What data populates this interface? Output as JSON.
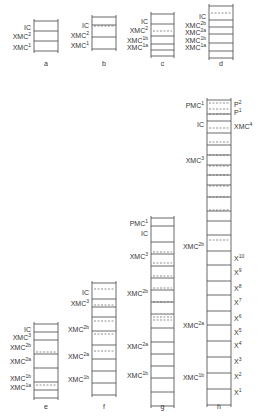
{
  "figure": {
    "width": 264,
    "height": 417,
    "stroke_color": "#444444",
    "panels": [
      {
        "id": "a",
        "label": "a",
        "x": 34,
        "w": 24,
        "top": 21,
        "label_y": 66,
        "segments": [
          10,
          10,
          10
        ],
        "dashed": [],
        "left_labels": [
          {
            "text": "IC",
            "sup": "",
            "y": 27
          },
          {
            "text": "XMC",
            "sup": "2",
            "y": 36
          },
          {
            "text": "XMC",
            "sup": "1",
            "y": 47
          }
        ],
        "right_labels": []
      },
      {
        "id": "b",
        "label": "b",
        "x": 92,
        "w": 24,
        "top": 17,
        "label_y": 66,
        "segments": [
          8,
          12,
          12
        ],
        "dashed": [
          26
        ],
        "left_labels": [
          {
            "text": "IC",
            "sup": "",
            "y": 25
          },
          {
            "text": "XMC",
            "sup": "2",
            "y": 35
          },
          {
            "text": "XMC",
            "sup": "1",
            "y": 45
          }
        ],
        "right_labels": []
      },
      {
        "id": "c",
        "label": "c",
        "x": 151,
        "w": 23,
        "top": 14,
        "label_y": 66,
        "segments": [
          10,
          12,
          8,
          6,
          6
        ],
        "dashed": [
          31
        ],
        "left_labels": [
          {
            "text": "IC",
            "sup": "",
            "y": 21
          },
          {
            "text": "XMC",
            "sup": "2",
            "y": 30
          },
          {
            "text": "XMC",
            "sup": "1b",
            "y": 40
          },
          {
            "text": "XMC",
            "sup": "1a",
            "y": 47
          }
        ],
        "right_labels": []
      },
      {
        "id": "d",
        "label": "d",
        "x": 209,
        "w": 24,
        "top": 6,
        "label_y": 66,
        "segments": [
          14,
          7,
          7,
          9,
          8,
          7
        ],
        "dashed": [
          13
        ],
        "left_labels": [
          {
            "text": "IC",
            "sup": "",
            "y": 16
          },
          {
            "text": "XMC",
            "sup": "2b",
            "y": 25
          },
          {
            "text": "XMC",
            "sup": "2a",
            "y": 32
          },
          {
            "text": "XMC",
            "sup": "1b",
            "y": 40
          },
          {
            "text": "XMC",
            "sup": "1a",
            "y": 47
          }
        ],
        "right_labels": []
      },
      {
        "id": "e",
        "label": "e",
        "x": 34,
        "w": 24,
        "top": 324,
        "label_y": 409,
        "segments": [
          8,
          8,
          14,
          14,
          14,
          8,
          8
        ],
        "dashed": [
          352,
          385
        ],
        "left_labels": [
          {
            "text": "IC",
            "sup": "",
            "y": 329
          },
          {
            "text": "XMC",
            "sup": "3",
            "y": 337
          },
          {
            "text": "XMC",
            "sup": "2b",
            "y": 347
          },
          {
            "text": "XMC",
            "sup": "2a",
            "y": 361
          },
          {
            "text": "XMC",
            "sup": "1b",
            "y": 378
          },
          {
            "text": "XMC",
            "sup": "1a",
            "y": 387
          }
        ],
        "right_labels": []
      },
      {
        "id": "f",
        "label": "f",
        "x": 92,
        "w": 24,
        "top": 283,
        "label_y": 409,
        "segments": [
          16,
          8,
          10,
          14,
          14,
          14,
          12,
          12,
          12
        ],
        "dashed": [
          289,
          305,
          321,
          334,
          351
        ],
        "left_labels": [
          {
            "text": "IC",
            "sup": "",
            "y": 292
          },
          {
            "text": "XMC",
            "sup": "3",
            "y": 303
          },
          {
            "text": "XMC",
            "sup": "2b",
            "y": 329
          },
          {
            "text": "XMC",
            "sup": "2a",
            "y": 356
          },
          {
            "text": "XMC",
            "sup": "1b",
            "y": 379
          }
        ],
        "right_labels": []
      },
      {
        "id": "g",
        "label": "g",
        "x": 151,
        "w": 23,
        "top": 218,
        "label_y": 409,
        "segments": [
          8,
          16,
          12,
          12,
          12,
          12,
          12,
          12,
          14,
          14,
          12,
          12,
          12,
          14,
          14
        ],
        "dashed": [
          252,
          263,
          276,
          288,
          302,
          317,
          320
        ],
        "left_labels": [
          {
            "text": "PMC",
            "sup": "1",
            "y": 223
          },
          {
            "text": "IC",
            "sup": "",
            "y": 233
          },
          {
            "text": "XMC",
            "sup": "3",
            "y": 256
          },
          {
            "text": "XMC",
            "sup": "2b",
            "y": 293
          },
          {
            "text": "XMC",
            "sup": "2a",
            "y": 346
          },
          {
            "text": "XMC",
            "sup": "1b",
            "y": 375
          }
        ],
        "right_labels": []
      },
      {
        "id": "h",
        "label": "h",
        "x": 207,
        "w": 24,
        "top": 100,
        "label_y": 409,
        "segments": [
          14,
          7,
          12,
          12,
          10,
          10,
          10,
          10,
          12,
          14,
          10,
          14,
          16,
          14,
          16,
          14,
          16,
          14,
          16,
          16,
          16,
          16,
          16
        ],
        "dashed": [
          103,
          109,
          114,
          128,
          142,
          155,
          166,
          175,
          186,
          197,
          210,
          240
        ],
        "left_labels": [
          {
            "text": "PMC",
            "sup": "1",
            "y": 105
          },
          {
            "text": "IC",
            "sup": "",
            "y": 124
          },
          {
            "text": "XMC",
            "sup": "3",
            "y": 160
          },
          {
            "text": "XMC",
            "sup": "2b",
            "y": 246
          },
          {
            "text": "XMC",
            "sup": "2a",
            "y": 325
          },
          {
            "text": "XMC",
            "sup": "1b",
            "y": 377
          }
        ],
        "right_labels": [
          {
            "text": "P",
            "sup": "2",
            "y": 104
          },
          {
            "text": "P",
            "sup": "1",
            "y": 112
          },
          {
            "text": "XMC",
            "sup": "4",
            "y": 126
          },
          {
            "text": "X",
            "sup": "10",
            "y": 258
          },
          {
            "text": "X",
            "sup": "9",
            "y": 272
          },
          {
            "text": "X",
            "sup": "8",
            "y": 288
          },
          {
            "text": "X",
            "sup": "7",
            "y": 302
          },
          {
            "text": "X",
            "sup": "6",
            "y": 318
          },
          {
            "text": "X",
            "sup": "5",
            "y": 332
          },
          {
            "text": "X",
            "sup": "4",
            "y": 345
          },
          {
            "text": "X",
            "sup": "3",
            "y": 361
          },
          {
            "text": "X",
            "sup": "2",
            "y": 376
          },
          {
            "text": "X",
            "sup": "1",
            "y": 392
          }
        ]
      }
    ]
  }
}
